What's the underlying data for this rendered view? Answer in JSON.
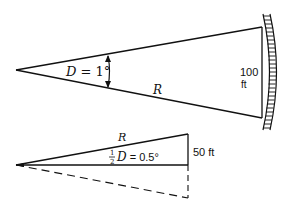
{
  "diagram": {
    "top_figure": {
      "angle_label_var": "D",
      "angle_label_eq": " = 1°",
      "radius_label": "R",
      "chord_label_value": "100",
      "chord_label_unit": "ft"
    },
    "bottom_figure": {
      "radius_label": "R",
      "half_numer": "1",
      "half_denom": "2",
      "angle_label_var": "D",
      "angle_label_eq": " = 0.5°",
      "side_label": "50 ft"
    },
    "colors": {
      "stroke": "#111111",
      "background": "#ffffff"
    }
  }
}
